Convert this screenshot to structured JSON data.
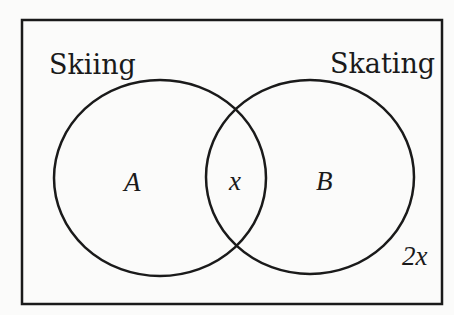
{
  "diagram": {
    "type": "venn",
    "universe_label": "",
    "sets": [
      {
        "name": "Skiing",
        "region_label": "A"
      },
      {
        "name": "Skating",
        "region_label": "B"
      }
    ],
    "intersection_label": "x",
    "outside_label": "2x",
    "colors": {
      "stroke": "#1a1a1a",
      "background": "#fbfbfa"
    }
  }
}
